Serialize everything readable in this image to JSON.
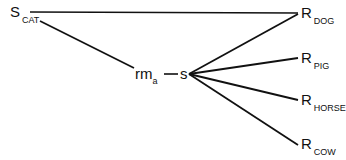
{
  "diagram": {
    "stimulus": {
      "main": "S",
      "sub": "CAT"
    },
    "mediator": {
      "main": "rm",
      "sub": "a"
    },
    "mediator_stimulus": {
      "main": "s"
    },
    "responses": [
      {
        "main": "R",
        "sub": "DOG"
      },
      {
        "main": "R",
        "sub": "PIG"
      },
      {
        "main": "R",
        "sub": "HORSE"
      },
      {
        "main": "R",
        "sub": "COW"
      }
    ],
    "line_color": "#111111"
  }
}
